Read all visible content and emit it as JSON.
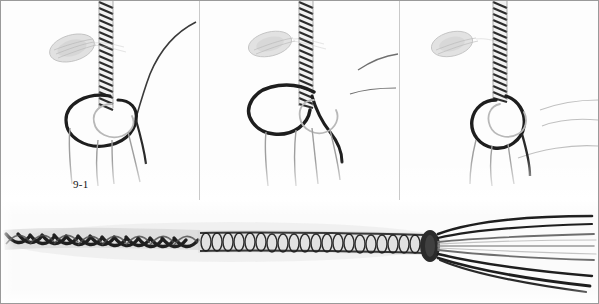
{
  "figure": {
    "panel_count": 4
  },
  "panels": [
    {
      "id": "panel-1",
      "caption": "9-1",
      "content": "Hook with thread wrapped body and loose thread loop forming around the hook shank"
    },
    {
      "id": "panel-2",
      "caption": "9-2",
      "content": "Hook with thread loop drawn into a closed loop around the hook shank"
    },
    {
      "id": "panel-3",
      "caption": "9-3",
      "content": "Hook with thread loop tightened and tag ends pulled downward"
    },
    {
      "id": "panel-4",
      "caption": "9-4",
      "content": "Completed braided cord with whipped section and free strand ends at right"
    }
  ],
  "colors": {
    "background": "#ffffff",
    "panel_background": "#fdfdfd",
    "frame": "#9a9a9a",
    "separator": "#c9c9c9",
    "thread_dark": "#1e1e1e",
    "thread_mid": "#6b6b6b",
    "thread_light": "#b4b4b4",
    "caption_text": "#111111"
  }
}
